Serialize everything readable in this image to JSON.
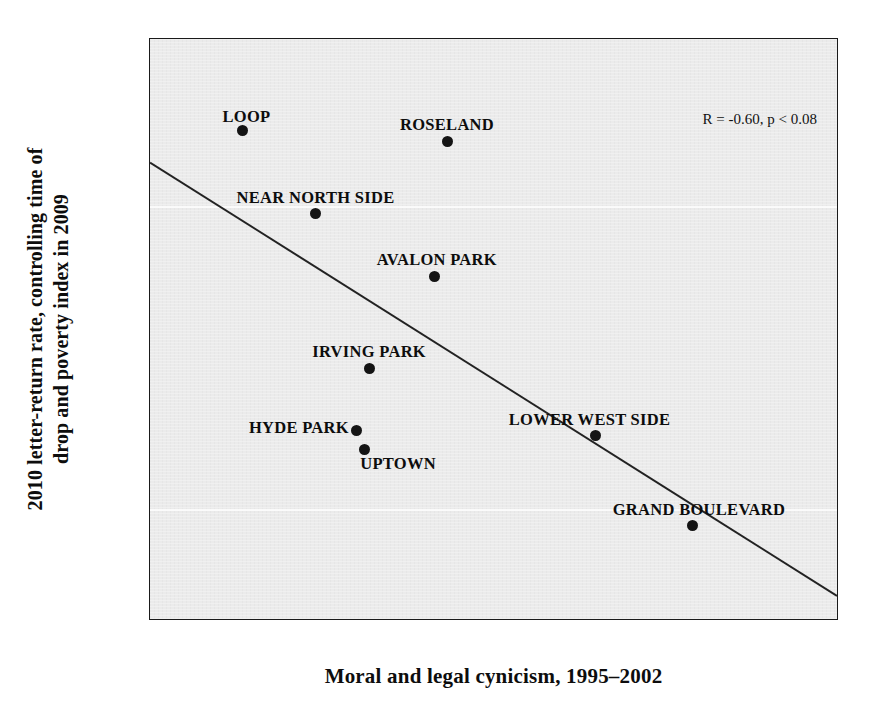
{
  "chart_data": {
    "type": "scatter",
    "title": "",
    "xlabel": "Moral and legal cynicism, 1995–2002",
    "ylabel_line1": "2010 letter-return rate, controlling time of",
    "ylabel_line2": "drop and poverty index in 2009",
    "xlim": [
      2.032,
      2.315
    ],
    "ylim": [
      -0.168,
      0.168
    ],
    "grid": false,
    "legend": "none",
    "annotation": "R = -0.60, p < 0.08",
    "xticks": [
      "2.05",
      "2.10",
      "2.15",
      "2.20",
      "2.25",
      "2.30"
    ],
    "xtick_values": [
      2.05,
      2.1,
      2.15,
      2.2,
      2.25,
      2.3
    ],
    "yticks": [
      "0.15",
      "0.10",
      "0.05",
      "0.00",
      "-0.05",
      "-0.10",
      "-0.15"
    ],
    "ytick_values": [
      0.15,
      0.1,
      0.05,
      0.0,
      -0.05,
      -0.1,
      -0.15
    ],
    "points": [
      {
        "label": "LOOP",
        "x": 2.07,
        "y": 0.115,
        "label_pos": "above-center",
        "dx": 4,
        "dy": -6
      },
      {
        "label": "ROSELAND",
        "x": 2.154,
        "y": 0.109,
        "label_pos": "above-center",
        "dx": 0,
        "dy": -8
      },
      {
        "label": "NEAR NORTH SIDE",
        "x": 2.1,
        "y": 0.067,
        "label_pos": "above-center",
        "dx": 0,
        "dy": -8
      },
      {
        "label": "AVALON PARK",
        "x": 2.149,
        "y": 0.031,
        "label_pos": "above-center",
        "dx": 2,
        "dy": -8
      },
      {
        "label": "IRVING PARK",
        "x": 2.122,
        "y": -0.022,
        "label_pos": "above-center",
        "dx": 0,
        "dy": -8
      },
      {
        "label": "HYDE PARK",
        "x": 2.117,
        "y": -0.058,
        "label_pos": "left",
        "dx": -8,
        "dy": -2
      },
      {
        "label": "UPTOWN",
        "x": 2.12,
        "y": -0.069,
        "label_pos": "below-right",
        "dx": -4,
        "dy": 6
      },
      {
        "label": "LOWER WEST SIDE",
        "x": 2.215,
        "y": -0.061,
        "label_pos": "above-center",
        "dx": -6,
        "dy": -8
      },
      {
        "label": "GRAND BOULEVARD",
        "x": 2.255,
        "y": -0.113,
        "label_pos": "above-center",
        "dx": 6,
        "dy": -8
      }
    ],
    "fit_line": {
      "name": "linear-fit",
      "x_start": 2.032,
      "y_start": 0.0965,
      "x_end": 2.315,
      "y_end": -0.1545
    },
    "colors": {
      "plot_background": "#ebebeb",
      "point": "#141414",
      "line": "#222222",
      "axis": "#1a1a1a",
      "text": "#0d0d0d",
      "figure_background": "#ffffff"
    }
  }
}
